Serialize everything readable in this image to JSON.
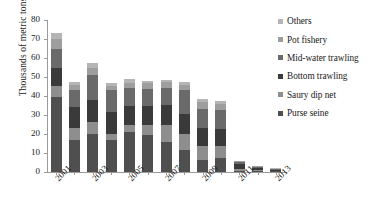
{
  "chart_data": {
    "type": "bar",
    "stacked": true,
    "title": "",
    "xlabel": "",
    "ylabel": "Thousands of metric tons",
    "ylim": [
      0,
      80
    ],
    "ytick_labels": [
      "0",
      "10",
      "20",
      "30",
      "40",
      "50",
      "60",
      "70",
      "80"
    ],
    "ytick_values": [
      0,
      10,
      20,
      30,
      40,
      50,
      60,
      70,
      80
    ],
    "grid": false,
    "legend_position": "right",
    "categories": [
      "2001",
      "2002",
      "2003",
      "2004",
      "2005",
      "2006",
      "2007",
      "2008",
      "2009",
      "2010",
      "2011",
      "2012",
      "2013"
    ],
    "xtick_labels_shown": [
      "2001",
      "",
      "2003",
      "",
      "2005",
      "",
      "2007",
      "",
      "2009",
      "",
      "2011",
      "",
      "2013"
    ],
    "series": [
      {
        "name": "Purse seine",
        "color": "#4f4f4f",
        "values": [
          39.5,
          16.8,
          20.0,
          16.6,
          21.0,
          19.5,
          15.8,
          11.8,
          6.5,
          7.5,
          0.6,
          0.4,
          0.3
        ]
      },
      {
        "name": "Saury dip net",
        "color": "#8e8e8e",
        "values": [
          6.0,
          6.3,
          6.2,
          3.6,
          3.9,
          5.3,
          8.7,
          8.3,
          7.4,
          6.4,
          0.9,
          0.5,
          0.3
        ]
      },
      {
        "name": "Bottom trawling",
        "color": "#3a3a3a",
        "values": [
          9.5,
          11.3,
          11.5,
          11.3,
          10.0,
          10.1,
          10.8,
          10.3,
          9.2,
          9.0,
          2.6,
          1.4,
          0.7
        ]
      },
      {
        "name": "Mid-water trawling",
        "color": "#6a6a6a",
        "values": [
          10.0,
          8.6,
          13.5,
          11.5,
          9.1,
          9.0,
          9.1,
          12.6,
          10.0,
          9.8,
          1.0,
          0.5,
          0.3
        ]
      },
      {
        "name": "Pot fishery",
        "color": "#9e9e9e",
        "values": [
          5.0,
          2.8,
          3.7,
          2.5,
          3.0,
          2.8,
          2.8,
          2.6,
          3.6,
          3.0,
          0.5,
          0.2,
          0.2
        ]
      },
      {
        "name": "Others",
        "color": "#b5b5b5",
        "values": [
          3.0,
          1.4,
          2.7,
          1.5,
          2.0,
          1.3,
          1.3,
          1.9,
          1.8,
          1.5,
          0.4,
          0.2,
          0.2
        ]
      }
    ],
    "totals": [
      73.0,
      47.2,
      57.6,
      47.0,
      49.0,
      48.0,
      48.5,
      47.5,
      38.5,
      37.2,
      6.0,
      3.2,
      2.0
    ]
  },
  "legend": {
    "items": [
      {
        "label": "Others",
        "color": "#b5b5b5"
      },
      {
        "label": "Pot fishery",
        "color": "#9e9e9e"
      },
      {
        "label": "Mid-water trawling",
        "color": "#6a6a6a"
      },
      {
        "label": "Bottom trawling",
        "color": "#3a3a3a"
      },
      {
        "label": "Saury dip net",
        "color": "#8e8e8e"
      },
      {
        "label": "Purse seine",
        "color": "#4f4f4f"
      }
    ]
  }
}
